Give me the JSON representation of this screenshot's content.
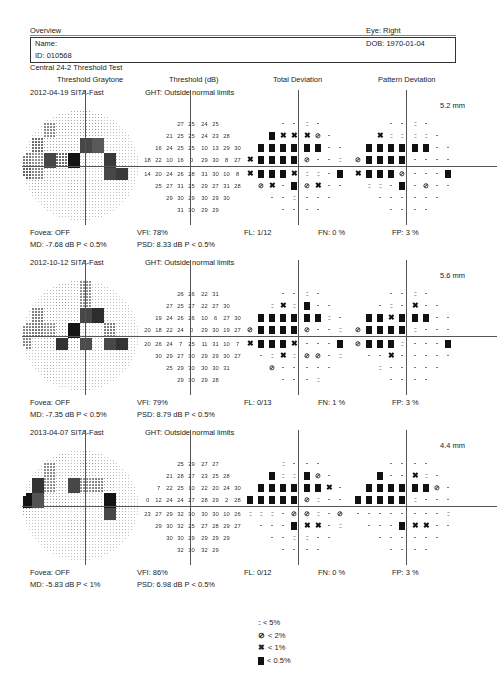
{
  "header": {
    "title": "Overview",
    "eye": "Eye: Right",
    "name_label": "Name:",
    "id": "ID: 010568",
    "dob": "DOB: 1970-01-04",
    "test_name": "Central 24-2 Threshold Test"
  },
  "columns": [
    "Threshold Graytone",
    "Threshold (dB)",
    "Total Deviation",
    "Pattern Deviation"
  ],
  "legend": [
    {
      "symbol": "::",
      "label": "< 5%"
    },
    {
      "symbol": "z",
      "label": "< 2%"
    },
    {
      "symbol": "x",
      "label": "< 1%"
    },
    {
      "symbol": "block",
      "label": "< 0.5%"
    }
  ],
  "tests": [
    {
      "date_strategy": "2012-04-19 SITA-Fast",
      "ght": "GHT: Outside normal limits",
      "pupil": "5.2 mm",
      "fovea": "Fovea: OFF",
      "md": "MD:  -7.68 dB  P < 0.5%",
      "vfi": "VFI:  78%",
      "psd": "PSD:  8.33 dB  P < 0.5%",
      "fl": "FL: 1/12",
      "fn": "FN:  0 %",
      "fp": "FP:  3 %",
      "threshold": [
        [
          "27",
          "25",
          "24",
          "25"
        ],
        [
          "21",
          "25",
          "25",
          "24",
          "23",
          "28"
        ],
        [
          "16",
          "24",
          "25",
          "25",
          "10",
          "13",
          "29",
          "30"
        ],
        [
          "18",
          "22",
          "10",
          "16",
          "0",
          "29",
          "30",
          "8",
          "27"
        ],
        [
          "14",
          "20",
          "24",
          "26",
          "28",
          "31",
          "30",
          "10",
          "8"
        ],
        [
          "25",
          "27",
          "31",
          "25",
          "29",
          "27",
          "31",
          "28"
        ],
        [
          "29",
          "30",
          "29",
          "30",
          "29",
          "30"
        ],
        [
          "31",
          "30",
          "29",
          "29"
        ]
      ],
      "total_dev": [
        [
          ".",
          ".",
          ":",
          "."
        ],
        [
          "B",
          "x",
          "x",
          "x",
          "z",
          "."
        ],
        [
          "B",
          "B",
          "B",
          "B",
          "B",
          "B",
          ".",
          "."
        ],
        [
          "x",
          "B",
          "B",
          "B",
          "B",
          "z",
          ".",
          ".",
          ":"
        ],
        [
          "x",
          "B",
          "B",
          "B",
          "x",
          ":",
          ":",
          ".",
          "B"
        ],
        [
          "z",
          "x",
          ".",
          "B",
          "z",
          "x",
          ".",
          "."
        ],
        [
          ".",
          ".",
          ":",
          ".",
          ".",
          "."
        ],
        [
          ".",
          ".",
          ".",
          "."
        ]
      ],
      "pattern_dev": [
        [
          ".",
          ".",
          ":",
          "."
        ],
        [
          "x",
          ":",
          ":",
          ":",
          ":",
          "."
        ],
        [
          "B",
          "B",
          "B",
          "B",
          "B",
          "B",
          ".",
          "."
        ],
        [
          "z",
          "B",
          "B",
          "B",
          "B",
          ".",
          ".",
          ".",
          "."
        ],
        [
          "x",
          "B",
          "B",
          "B",
          "z",
          ".",
          ".",
          ".",
          "B"
        ],
        [
          ":",
          ":",
          ".",
          "B",
          ".",
          "z",
          ".",
          "."
        ],
        [
          ".",
          ".",
          ".",
          ".",
          ".",
          "."
        ],
        [
          ".",
          ".",
          ".",
          "."
        ]
      ]
    },
    {
      "date_strategy": "2012-10-12 SITA-Fast",
      "ght": "GHT: Outside normal limits",
      "pupil": "5.6 mm",
      "fovea": "Fovea: OFF",
      "md": "MD:  -7.35 dB  P < 0.5%",
      "vfi": "VFI:  79%",
      "psd": "PSD:  8.79 dB  P < 0.5%",
      "fl": "FL: 0/13",
      "fn": "FN:  1 %",
      "fp": "FP:  3 %",
      "threshold": [
        [
          "26",
          "26",
          "22",
          "31"
        ],
        [
          "27",
          "25",
          "27",
          "22",
          "27",
          "30"
        ],
        [
          "19",
          "24",
          "26",
          "26",
          "10",
          "6",
          "27",
          "30"
        ],
        [
          "20",
          "18",
          "22",
          "24",
          "0",
          "29",
          "30",
          "19",
          "27"
        ],
        [
          "20",
          "26",
          "24",
          "7",
          "25",
          "11",
          "31",
          "10",
          "7"
        ],
        [
          "30",
          "29",
          "27",
          "30",
          "29",
          "29",
          "30",
          "27"
        ],
        [
          "25",
          "29",
          "30",
          "30",
          "30",
          "31"
        ],
        [
          "29",
          "30",
          "29",
          "28"
        ]
      ],
      "total_dev": [
        [
          ".",
          ".",
          ":",
          "."
        ],
        [
          ":",
          "x",
          ":",
          "B",
          ".",
          "."
        ],
        [
          "B",
          "B",
          "B",
          "B",
          "B",
          "B",
          ":",
          "."
        ],
        [
          "z",
          "B",
          "B",
          "B",
          "B",
          "z",
          ".",
          ".",
          ":"
        ],
        [
          "x",
          "B",
          "B",
          "B",
          "x",
          ".",
          ".",
          ".",
          "B"
        ],
        [
          ".",
          ":",
          "x",
          ":",
          "z",
          "z",
          ".",
          ":"
        ],
        [
          "z",
          ".",
          ".",
          ".",
          ".",
          "."
        ],
        [
          ".",
          ".",
          ".",
          ":"
        ]
      ],
      "pattern_dev": [
        [
          ".",
          ".",
          ":",
          "."
        ],
        [
          ".",
          ":",
          ".",
          "x",
          ".",
          "."
        ],
        [
          "B",
          "B",
          "x",
          "B",
          "B",
          "B",
          ".",
          "."
        ],
        [
          "z",
          "B",
          "B",
          "B",
          "B",
          ":",
          ".",
          ".",
          "."
        ],
        [
          "z",
          "B",
          "B",
          "B",
          ":",
          ".",
          ".",
          ".",
          "B"
        ],
        [
          ".",
          ".",
          "x",
          ".",
          ".",
          ".",
          ".",
          "."
        ],
        [
          ":",
          ".",
          ".",
          ".",
          ".",
          "."
        ],
        [
          ".",
          ".",
          ".",
          "."
        ]
      ]
    },
    {
      "date_strategy": "2013-04-07 SITA-Fast",
      "ght": "GHT: Outside normal limits",
      "pupil": "4.4 mm",
      "fovea": "Fovea: OFF",
      "md": "MD:  -5.83 dB  P < 1%",
      "vfi": "VFI:  86%",
      "psd": "PSD:  6.98 dB  P < 0.5%",
      "fl": "FL: 0/12",
      "fn": "FN:  0 %",
      "fp": "FP:  3 %",
      "threshold": [
        [
          "25",
          "29",
          "27",
          "27"
        ],
        [
          "21",
          "28",
          "27",
          "23",
          "25",
          "28"
        ],
        [
          "7",
          "22",
          "25",
          "10",
          "22",
          "20",
          "24",
          "30"
        ],
        [
          "0",
          "12",
          "24",
          "24",
          "27",
          "28",
          "29",
          "2",
          "28"
        ],
        [
          "23",
          "27",
          "29",
          "32",
          "30",
          "30",
          "30",
          "10",
          "26"
        ],
        [
          "29",
          "30",
          "32",
          "25",
          "27",
          "28",
          "29",
          "27"
        ],
        [
          "30",
          "30",
          "29",
          "29",
          "29",
          "29"
        ],
        [
          "32",
          "30",
          "32",
          "29"
        ]
      ],
      "total_dev": [
        [
          ":",
          ".",
          ".",
          "."
        ],
        [
          "B",
          ":",
          ":",
          "B",
          "z",
          "."
        ],
        [
          "B",
          "B",
          "B",
          "B",
          "B",
          "B",
          "x",
          "."
        ],
        [
          "B",
          "B",
          "B",
          "B",
          "B",
          "z",
          ":",
          ".",
          "."
        ],
        [
          ":",
          ":",
          ":",
          ".",
          "z",
          "z",
          ":",
          ".",
          "z"
        ],
        [
          ".",
          ".",
          ".",
          "B",
          "x",
          "x",
          ".",
          ":"
        ],
        [
          ".",
          ".",
          ":",
          ":",
          ".",
          "."
        ],
        [
          ".",
          ".",
          ".",
          "."
        ]
      ],
      "pattern_dev": [
        [
          ".",
          ".",
          ".",
          "."
        ],
        [
          "B",
          ".",
          ".",
          "x",
          ":",
          "."
        ],
        [
          "B",
          "B",
          "B",
          "B",
          "B",
          "B",
          "z",
          "."
        ],
        [
          "B",
          "B",
          "B",
          "B",
          "B",
          ":",
          ".",
          ".",
          "."
        ],
        [
          ".",
          ".",
          ".",
          ".",
          ".",
          ".",
          ".",
          ".",
          ":"
        ],
        [
          ".",
          ".",
          ".",
          "B",
          "x",
          "x",
          ".",
          "."
        ],
        [
          ".",
          ".",
          ".",
          ".",
          ".",
          "."
        ],
        [
          ".",
          ".",
          ".",
          "."
        ]
      ]
    }
  ]
}
